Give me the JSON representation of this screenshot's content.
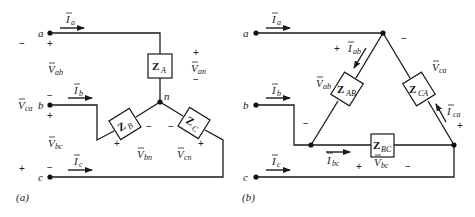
{
  "figure": {
    "panel_a": {
      "caption": "(a)",
      "nodes": {
        "a": "a",
        "b": "b",
        "c": "c",
        "n": "n"
      },
      "currents": {
        "Ia": {
          "main": "I",
          "sub": "a"
        },
        "Ib": {
          "main": "I",
          "sub": "b"
        },
        "Ic": {
          "main": "I",
          "sub": "c"
        }
      },
      "voltages": {
        "Vab": {
          "main": "V",
          "sub": "ab"
        },
        "Vca": {
          "main": "V",
          "sub": "ca"
        },
        "Vbc": {
          "main": "V",
          "sub": "bc"
        },
        "Van": {
          "main": "V",
          "sub": "an"
        },
        "Vbn": {
          "main": "V",
          "sub": "bn"
        },
        "Vcn": {
          "main": "V",
          "sub": "cn"
        }
      },
      "impedances": {
        "ZA": {
          "main": "Z",
          "sub": "A"
        },
        "ZB": {
          "main": "Z",
          "sub": "B"
        },
        "ZC": {
          "main": "Z",
          "sub": "C"
        }
      },
      "signs": {
        "plus": "+",
        "minus": "−"
      }
    },
    "panel_b": {
      "caption": "(b)",
      "nodes": {
        "a": "a",
        "b": "b",
        "c": "c"
      },
      "currents": {
        "Ia": {
          "main": "I",
          "sub": "a"
        },
        "Ib": {
          "main": "I",
          "sub": "b"
        },
        "Ic": {
          "main": "I",
          "sub": "c"
        },
        "Iab": {
          "main": "I",
          "sub": "ab"
        },
        "Ibc": {
          "main": "I",
          "sub": "bc"
        },
        "Ica": {
          "main": "I",
          "sub": "ca"
        }
      },
      "voltages": {
        "Vab": {
          "main": "V",
          "sub": "ab"
        },
        "Vbc": {
          "main": "V",
          "sub": "bc"
        },
        "Vca": {
          "main": "V",
          "sub": "ca"
        }
      },
      "impedances": {
        "ZAB": {
          "main": "Z",
          "sub": "AB"
        },
        "ZBC": {
          "main": "Z",
          "sub": "BC"
        },
        "ZCA": {
          "main": "Z",
          "sub": "CA"
        }
      },
      "signs": {
        "plus": "+",
        "minus": "−"
      }
    }
  }
}
